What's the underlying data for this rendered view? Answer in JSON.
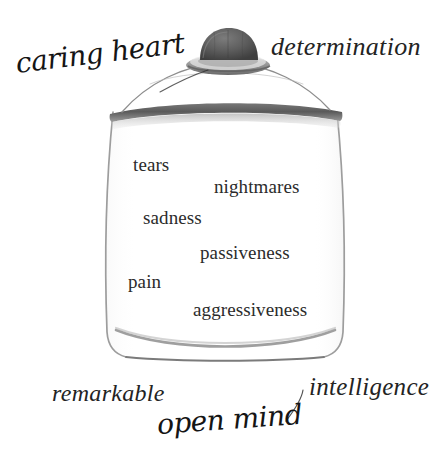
{
  "image": {
    "title": "Jar of feelings illustration",
    "background_color": "#ffffff",
    "ink_color": "#2b2b2b"
  },
  "jar": {
    "name": "glass-jar",
    "lid": {
      "knob_label": "knob",
      "rim_color": "#6f6f6f",
      "knob_color": "#4f4f4f"
    },
    "glass_color": "#9a9a9a",
    "inner_words": [
      {
        "label": "tears",
        "x": 133,
        "y": 155
      },
      {
        "label": "nightmares",
        "x": 214,
        "y": 177
      },
      {
        "label": "sadness",
        "x": 143,
        "y": 208
      },
      {
        "label": "passiveness",
        "x": 200,
        "y": 243
      },
      {
        "label": "pain",
        "x": 128,
        "y": 272
      },
      {
        "label": "aggressiveness",
        "x": 193,
        "y": 300
      }
    ]
  },
  "outer_words": [
    {
      "label": "caring heart",
      "style": "script",
      "x": 16,
      "y": 50,
      "rotate": -7,
      "size": 28
    },
    {
      "label": "determination",
      "style": "italic",
      "x": 271,
      "y": 34,
      "rotate": 0,
      "size": 26
    },
    {
      "label": "remarkable",
      "style": "italic",
      "x": 52,
      "y": 381,
      "rotate": 0,
      "size": 24
    },
    {
      "label": "intelligence",
      "style": "italic",
      "x": 309,
      "y": 374,
      "rotate": 0,
      "size": 25
    },
    {
      "label": "open mind",
      "style": "script",
      "x": 157,
      "y": 411,
      "rotate": -4,
      "size": 28
    }
  ],
  "colors": {
    "ink": "#2b2b2b",
    "glass_outline": "#9a9a9a",
    "lid_dark": "#5c5c5c",
    "lid_mid": "#8a8a8a",
    "lid_light": "#c9c9c9"
  }
}
